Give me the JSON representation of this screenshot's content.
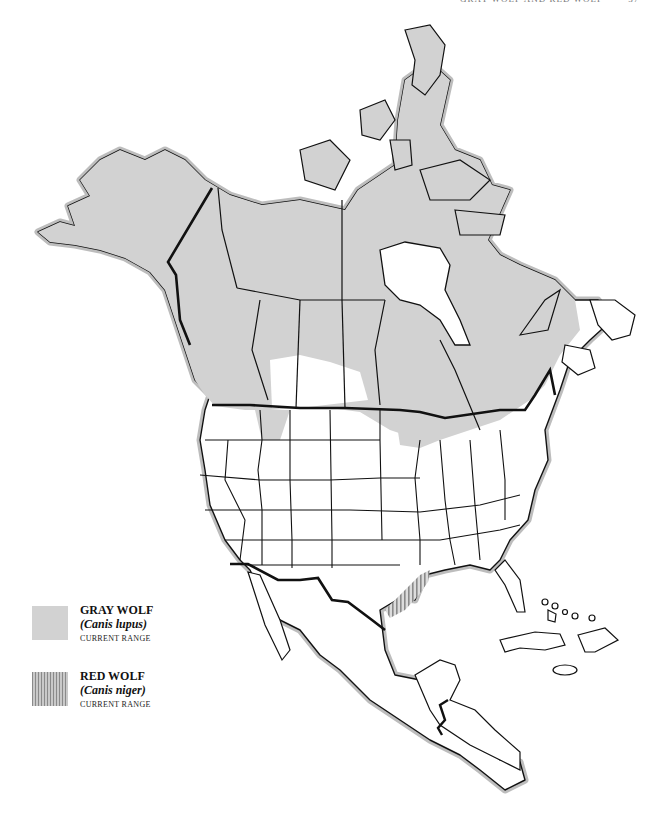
{
  "header": {
    "running_title": "GRAY WOLF AND RED WOLF",
    "page_number": "37"
  },
  "map": {
    "region": "North America",
    "fill_colors": {
      "gray_wolf_range": "#d2d2d2",
      "red_wolf_range_stripe": "#8a8a8a",
      "land": "#ffffff",
      "border": "#111111"
    }
  },
  "legend": {
    "items": [
      {
        "name": "GRAY WOLF",
        "scientific": "(Canis lupus)",
        "subtitle": "CURRENT RANGE",
        "pattern": "solid-gray"
      },
      {
        "name": "RED WOLF",
        "scientific": "(Canis niger)",
        "subtitle": "CURRENT RANGE",
        "pattern": "vertical-stripes"
      }
    ]
  }
}
